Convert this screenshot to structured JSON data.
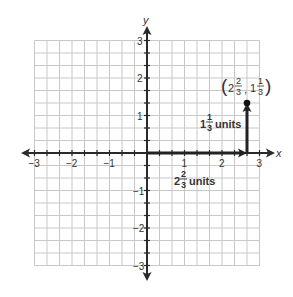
{
  "chart_data": {
    "type": "scatter",
    "title": "",
    "xlabel": "x",
    "ylabel": "y",
    "xlim": [
      -3,
      3
    ],
    "ylim": [
      -3,
      3
    ],
    "grid": true,
    "grid_step": 0.3333,
    "x_ticks": [
      "-3",
      "-2",
      "-1",
      "1",
      "2",
      "3"
    ],
    "y_ticks": [
      "3",
      "2",
      "1",
      "-1",
      "-2",
      "-3"
    ],
    "points": [
      {
        "x": 2.6667,
        "y": 1.3333,
        "label": "(2 2/3, 1 1/3)"
      }
    ],
    "arrows": [
      {
        "from": [
          0,
          0
        ],
        "to": [
          2.6667,
          0
        ],
        "label": "2 2/3 units"
      },
      {
        "from": [
          2.6667,
          0
        ],
        "to": [
          2.6667,
          1.3333
        ],
        "label": "1 1/3 units"
      }
    ]
  },
  "axes": {
    "x_label": "x",
    "y_label": "y",
    "x_ticks": [
      {
        "v": -3,
        "label": "−3"
      },
      {
        "v": -2,
        "label": "−2"
      },
      {
        "v": -1,
        "label": "−1"
      },
      {
        "v": 1,
        "label": "1"
      },
      {
        "v": 2,
        "label": "2"
      },
      {
        "v": 3,
        "label": "3"
      }
    ],
    "y_ticks": [
      {
        "v": 3,
        "label": "3"
      },
      {
        "v": 2,
        "label": "2"
      },
      {
        "v": 1,
        "label": "1"
      },
      {
        "v": -1,
        "label": "−1"
      },
      {
        "v": -2,
        "label": "−2"
      },
      {
        "v": -3,
        "label": "−3"
      }
    ]
  },
  "annotations": {
    "point": {
      "whole_x": "2",
      "num_x": "2",
      "den_x": "3",
      "whole_y": "1",
      "num_y": "1",
      "den_y": "3",
      "open": "(",
      "close": ")",
      "comma": ","
    },
    "horizontal": {
      "whole": "2",
      "num": "2",
      "den": "3",
      "unit": "units"
    },
    "vertical": {
      "whole": "1",
      "num": "1",
      "den": "3",
      "unit": "units"
    }
  },
  "colors": {
    "grid": "#c8c8c8",
    "axis": "#2a2a2a",
    "arrow": "#222222",
    "text": "#333333"
  }
}
